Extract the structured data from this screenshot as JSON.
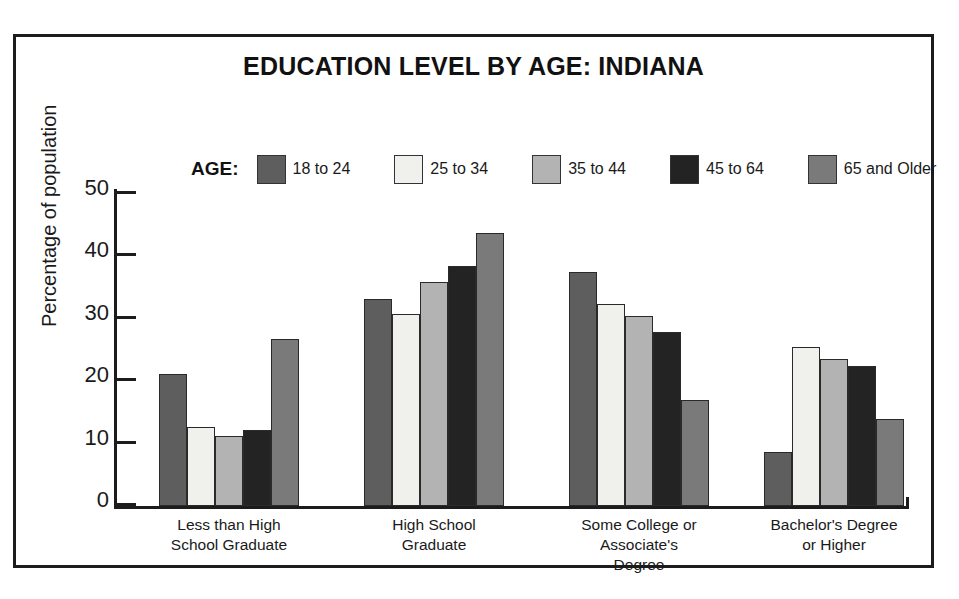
{
  "chart_data": {
    "type": "bar",
    "title": "EDUCATION LEVEL BY AGE:  INDIANA",
    "xlabel": "",
    "ylabel": "Percentage of population",
    "ylim": [
      0,
      50
    ],
    "yticks": [
      0,
      10,
      20,
      30,
      40,
      50
    ],
    "ytick_labels": [
      "0",
      "10",
      "20",
      "30",
      "40",
      "50"
    ],
    "grid": false,
    "legend_title": "AGE:",
    "legend_position": "top",
    "categories": [
      "Less than High\nSchool Graduate",
      "High School\nGraduate",
      "Some College or\nAssociate's\nDegree",
      "Bachelor's Degree\nor Higher"
    ],
    "series": [
      {
        "name": "18 to 24",
        "color": "#5e5e5e",
        "values": [
          21.2,
          33.2,
          37.4,
          8.6
        ]
      },
      {
        "name": "25 to 34",
        "color": "#f0f0ec",
        "values": [
          12.6,
          30.8,
          32.3,
          25.5
        ]
      },
      {
        "name": "35 to 44",
        "color": "#b3b3b3",
        "values": [
          11.2,
          35.9,
          30.4,
          23.5
        ]
      },
      {
        "name": "45 to 64",
        "color": "#232323",
        "values": [
          12.1,
          38.4,
          27.9,
          22.5
        ]
      },
      {
        "name": "65 and Older",
        "color": "#7a7a7a",
        "values": [
          26.7,
          43.7,
          16.9,
          14.0
        ]
      }
    ]
  },
  "frame": {
    "border_color": "#1c1c1c",
    "background": "#ffffff"
  }
}
